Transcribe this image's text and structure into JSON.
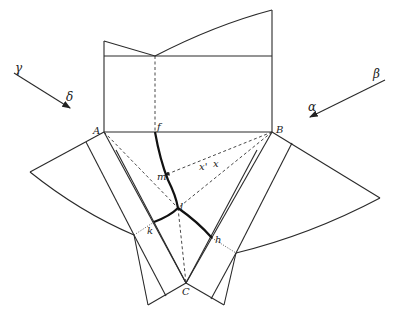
{
  "diagram": {
    "point_labels": {
      "A": "A",
      "B": "B",
      "C": "C",
      "f": "f",
      "m": "m",
      "l": "l",
      "k": "k",
      "h": "h",
      "x": "x",
      "x_prime": "x'"
    },
    "direction_labels": {
      "gamma": "γ",
      "delta": "δ",
      "alpha": "α",
      "beta": "β"
    },
    "colors": {
      "line": "#2a2a2a",
      "background": "#ffffff"
    }
  }
}
